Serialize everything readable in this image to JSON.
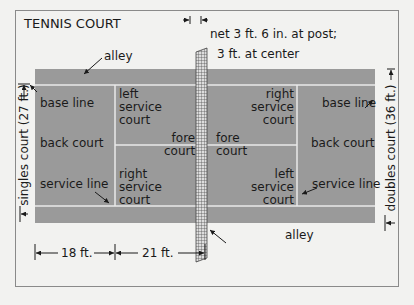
{
  "title": "TENNIS COURT",
  "colors": {
    "court": "#9a9a9a",
    "lines": "#e8e8e8",
    "ink": "#1a1a1a",
    "frame": "#8a8a8a"
  },
  "net": {
    "label_line1": "net 3 ft. 6 in. at post;",
    "label_line2": "3 ft. at center"
  },
  "alley_top": "alley",
  "alley_bottom": "alley",
  "left_half": {
    "base_line": "base line",
    "back_court": "back court",
    "service_line": "service line",
    "left_service_court": [
      "left",
      "service",
      "court"
    ],
    "right_service_court": [
      "right",
      "service",
      "court"
    ],
    "fore_court": [
      "fore",
      "court"
    ]
  },
  "right_half": {
    "base_line": "base line",
    "back_court": "back court",
    "service_line": "service line",
    "right_service_court": [
      "right",
      "service",
      "court"
    ],
    "left_service_court": [
      "left",
      "service",
      "court"
    ],
    "fore_court": [
      "fore",
      "court"
    ]
  },
  "dimensions": {
    "singles": "singles court (27 ft.)",
    "doubles": "doubles court (36 ft.)",
    "back_length": "18 ft.",
    "service_length": "21 ft."
  }
}
